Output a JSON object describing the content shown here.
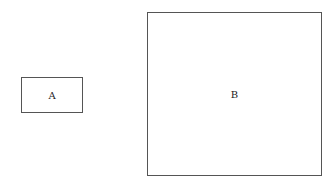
{
  "diagram": {
    "boxes": [
      {
        "id": "A",
        "label": "A"
      },
      {
        "id": "B",
        "label": "B"
      }
    ]
  }
}
